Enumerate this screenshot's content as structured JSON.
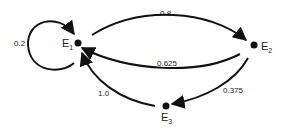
{
  "diagram": {
    "type": "state-transition-graph",
    "nodes": [
      {
        "id": "E1",
        "label": "E",
        "subscript": "1"
      },
      {
        "id": "E2",
        "label": "E",
        "subscript": "2"
      },
      {
        "id": "E3",
        "label": "E",
        "subscript": "3"
      }
    ],
    "edges": [
      {
        "from": "E1",
        "to": "E1",
        "label": "0.2"
      },
      {
        "from": "E1",
        "to": "E2",
        "label": "0.8"
      },
      {
        "from": "E2",
        "to": "E1",
        "label": "0.625"
      },
      {
        "from": "E2",
        "to": "E3",
        "label": "0.375"
      },
      {
        "from": "E3",
        "to": "E1",
        "label": "1.0"
      }
    ],
    "colors": {
      "line": "#111111",
      "text": "#222222",
      "background": "#ffffff"
    }
  }
}
